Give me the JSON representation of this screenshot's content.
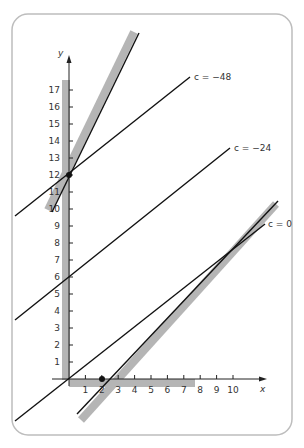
{
  "figure": {
    "frame_color": "#bdbdbd",
    "band_color": "#b5b5b5",
    "line_color": "#111111",
    "axes": {
      "x_label": "x",
      "y_label": "y",
      "x_ticks": [
        "1",
        "2",
        "3",
        "4",
        "5",
        "6",
        "7",
        "8",
        "9",
        "10"
      ],
      "y_ticks": [
        "1",
        "2",
        "3",
        "4",
        "5",
        "6",
        "7",
        "8",
        "9",
        "10",
        "11",
        "12",
        "13",
        "14",
        "15",
        "16",
        "17"
      ]
    },
    "lines": [
      {
        "label": "c = −48",
        "y_intercept": 12
      },
      {
        "label": "c = −24",
        "y_intercept": 6
      },
      {
        "label": "c = 0",
        "y_intercept": 0
      }
    ],
    "points": [
      {
        "x": 0,
        "y": 12
      },
      {
        "x": 2,
        "y": 0
      }
    ]
  }
}
